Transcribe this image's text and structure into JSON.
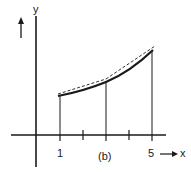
{
  "figure": {
    "label": "(b)",
    "y_axis_label": "y",
    "x_axis_label": "x",
    "x_ticks": [
      {
        "value": 1,
        "label": "1"
      },
      {
        "value": 2,
        "label": ""
      },
      {
        "value": 3,
        "label": ""
      },
      {
        "value": 4,
        "label": ""
      },
      {
        "value": 5,
        "label": "5"
      }
    ],
    "curve": {
      "style": "solid-thick",
      "x_range": [
        1,
        5
      ],
      "points": [
        [
          1,
          95
        ],
        [
          3,
          81
        ],
        [
          5,
          51
        ]
      ]
    },
    "chords": {
      "style": "dashed",
      "segments": [
        [
          [
            1,
            95
          ],
          [
            3,
            80
          ]
        ],
        [
          [
            3,
            80
          ],
          [
            5,
            47
          ]
        ]
      ]
    },
    "ordinates": [
      1,
      3,
      5
    ],
    "ink_color": "#1a1a1a"
  }
}
